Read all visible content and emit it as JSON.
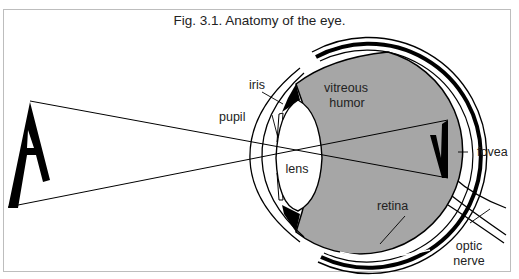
{
  "figure": {
    "title": "Fig. 3.1. Anatomy of the eye.",
    "labels": {
      "iris": "iris",
      "pupil": "pupil",
      "vitreous_1": "vitreous",
      "vitreous_2": "humor",
      "lens": "lens",
      "fovea": "fovea",
      "retina": "retina",
      "optic_1": "optic",
      "optic_2": "nerve"
    },
    "object_glyph": "A",
    "colors": {
      "vitreous_fill": "#a6a6a6",
      "stroke": "#000000",
      "frame": "#bdbdbd"
    }
  }
}
